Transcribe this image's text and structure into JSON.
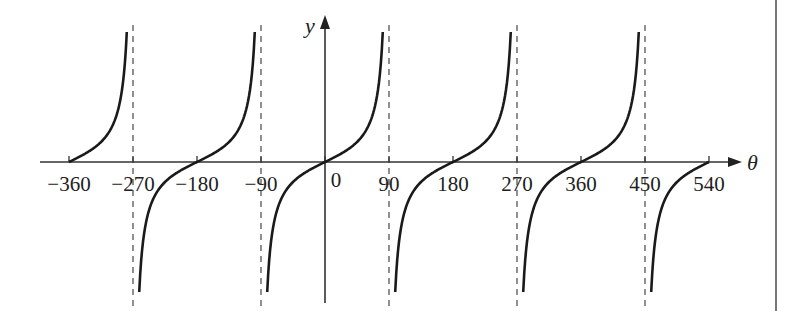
{
  "chart_data": {
    "type": "line",
    "title": "",
    "function": "y = tan θ",
    "xlabel": "θ",
    "ylabel": "y",
    "xlim": [
      -360,
      540
    ],
    "ylim": [
      -6.5,
      6.5
    ],
    "x_ticks": [
      -360,
      -270,
      -180,
      -90,
      0,
      90,
      180,
      270,
      360,
      450,
      540
    ],
    "x_tick_labels": [
      "−360",
      "−270",
      "−180",
      "−90",
      "0",
      "90",
      "180",
      "270",
      "360",
      "450",
      "540"
    ],
    "asymptotes": [
      -270,
      -90,
      90,
      270,
      450
    ],
    "asymptote_style": "dashed",
    "zeros": [
      -360,
      -180,
      0,
      180,
      360,
      540
    ],
    "grid": false,
    "series": [
      {
        "name": "tan θ",
        "x": [
          -360,
          -315,
          -300,
          -285,
          -280,
          -275,
          -270,
          -265,
          -260,
          -255,
          -240,
          -225,
          -180,
          -135,
          -120,
          -105,
          -100,
          -95,
          -90,
          -85,
          -80,
          -75,
          -60,
          -45,
          0,
          45,
          60,
          75,
          80,
          85,
          90,
          95,
          100,
          105,
          120,
          135,
          180,
          225,
          240,
          255,
          260,
          265,
          270,
          275,
          280,
          285,
          300,
          315,
          360,
          405,
          420,
          435,
          440,
          445,
          450,
          455,
          460,
          465,
          480,
          495,
          540
        ],
        "values": [
          0,
          1,
          1.73,
          3.73,
          5.67,
          11.43,
          null,
          -11.43,
          -5.67,
          -3.73,
          -1.73,
          -1,
          0,
          1,
          1.73,
          3.73,
          5.67,
          11.43,
          null,
          -11.43,
          -5.67,
          -3.73,
          -1.73,
          -1,
          0,
          1,
          1.73,
          3.73,
          5.67,
          11.43,
          null,
          -11.43,
          -5.67,
          -3.73,
          -1.73,
          -1,
          0,
          1,
          1.73,
          3.73,
          5.67,
          11.43,
          null,
          -11.43,
          -5.67,
          -3.73,
          -1.73,
          -1,
          0,
          1,
          1.73,
          3.73,
          5.67,
          11.43,
          null,
          -11.43,
          -5.67,
          -3.73,
          -1.73,
          -1,
          0
        ]
      }
    ]
  },
  "layout": {
    "origin_px": [
      325,
      162
    ],
    "px_per_degree": 0.7111,
    "px_per_unit_y": 20,
    "curve_y_limit": 6.5,
    "axis_left_px": 40,
    "axis_right_px": 742,
    "yaxis_top_px": 15,
    "yaxis_bottom_px": 303,
    "asym_top_px": 25,
    "asym_bottom_px": 306,
    "border_x_px": 776
  },
  "colors": {
    "curve": "#1a1a1a",
    "axis": "#333333",
    "asymptote": "#555555",
    "border": "#555555"
  }
}
